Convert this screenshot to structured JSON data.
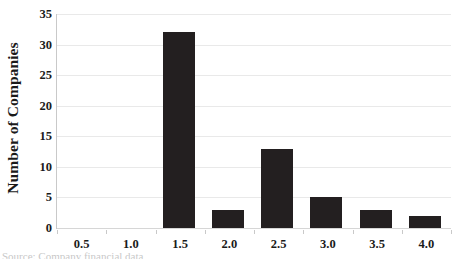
{
  "chart_data": {
    "type": "bar",
    "title": "",
    "subtitle": "",
    "xlabel": "",
    "ylabel": "Number of Companies",
    "categories": [
      "0.5",
      "1.0",
      "1.5",
      "2.0",
      "2.5",
      "3.0",
      "3.5",
      "4.0"
    ],
    "values": [
      0,
      0,
      32,
      3,
      13,
      5,
      3,
      2
    ],
    "series": [
      {
        "name": "Number of Companies",
        "values": [
          0,
          0,
          32,
          3,
          13,
          5,
          3,
          2
        ]
      }
    ],
    "ylim": [
      0,
      35
    ],
    "ytick_labels": [
      "0",
      "5",
      "10",
      "15",
      "20",
      "25",
      "30",
      "35"
    ],
    "ytick_values": [
      0,
      5,
      10,
      15,
      20,
      25,
      30,
      35
    ],
    "grid": "horizontal",
    "legend": "none",
    "bar_color": "#231f20",
    "gridline_color": "#e9e9e9",
    "background_color": "#ffffff",
    "text_color": "#1a1a1a",
    "annotations": []
  },
  "axes": {
    "y_title": "Number of Companies"
  },
  "footer": {
    "clipped_caption": "Source: Company financial data"
  }
}
